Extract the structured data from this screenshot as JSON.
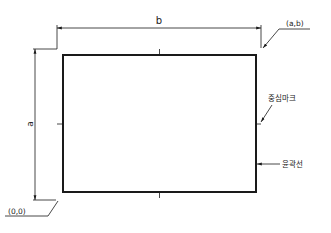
{
  "diagram": {
    "title": "",
    "dimension_width_label": "b",
    "dimension_height_label": "a",
    "origin_label": "(0,0)",
    "corner_label": "(a,b)",
    "center_mark_label": "중심마크",
    "border_line_label": "윤곽선",
    "colors": {
      "line": "#1a1a1a",
      "background": "#ffffff"
    }
  }
}
